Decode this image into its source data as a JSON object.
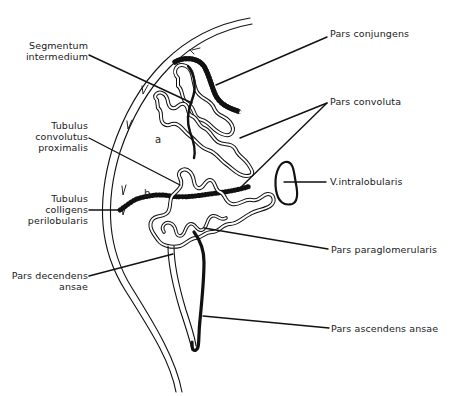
{
  "figure": {
    "type": "anatomical-diagram",
    "colors": {
      "line": "#111111",
      "background": "#ffffff"
    },
    "regions": {
      "a": "a",
      "b": "b"
    },
    "labels_left": [
      {
        "id": "segmentum-intermedium",
        "lines": [
          "Segmentum",
          "intermedium"
        ]
      },
      {
        "id": "tubulus-convolutus-proximalis",
        "lines": [
          "Tubulus",
          "convolutus",
          "proximalis"
        ]
      },
      {
        "id": "tubulus-colligens-perilobularis",
        "lines": [
          "Tubulus",
          "colligens",
          "perilobularis"
        ]
      },
      {
        "id": "pars-decendens-ansae",
        "lines": [
          "Pars decendens",
          "ansae"
        ]
      }
    ],
    "labels_right": [
      {
        "id": "pars-conjungens",
        "text": "Pars conjungens"
      },
      {
        "id": "pars-convoluta",
        "text": "Pars convoluta"
      },
      {
        "id": "v-intralobularis",
        "text": "V.intralobularis"
      },
      {
        "id": "pars-paraglomerularis",
        "text": "Pars paraglomerularis"
      },
      {
        "id": "pars-ascendens-ansae",
        "text": "Pars ascendens ansae"
      }
    ]
  }
}
